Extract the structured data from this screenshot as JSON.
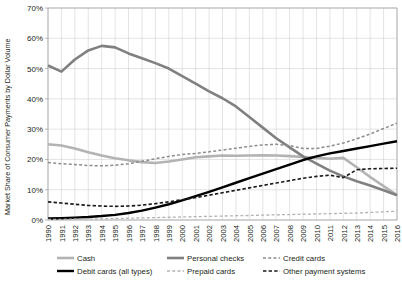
{
  "chart_data": {
    "type": "line",
    "title": "",
    "xlabel": "",
    "ylabel": "Market Share of Consumer Payments by Dollar Volume",
    "ylim": [
      0,
      70
    ],
    "ytick_labels": [
      "0%",
      "10%",
      "20%",
      "30%",
      "40%",
      "50%",
      "60%",
      "70%"
    ],
    "ytick_values": [
      0,
      10,
      20,
      30,
      40,
      50,
      60,
      70
    ],
    "grid": true,
    "legend_position": "bottom",
    "x": [
      1990,
      1991,
      1992,
      1993,
      1994,
      1995,
      1996,
      1997,
      1998,
      1999,
      2000,
      2001,
      2002,
      2003,
      2004,
      2005,
      2006,
      2007,
      2008,
      2009,
      2010,
      2011,
      2012,
      2013,
      2014,
      2015,
      2016
    ],
    "xtick_labels": [
      "1990",
      "1991",
      "1992",
      "1993",
      "1994",
      "1995",
      "1996",
      "1997",
      "1998",
      "1999",
      "2000",
      "2001",
      "2002",
      "2003",
      "2004",
      "2005",
      "2006",
      "2007",
      "2008",
      "2009",
      "2010",
      "2011",
      "2012",
      "2013",
      "2014",
      "2015",
      "2016"
    ],
    "series": [
      {
        "name": "Cash",
        "color": "#b3b3b3",
        "style": "solid",
        "width": 2.6,
        "values": [
          25.0,
          24.6,
          23.6,
          22.4,
          21.3,
          20.4,
          19.7,
          19.1,
          18.8,
          19.3,
          20.0,
          20.7,
          21.0,
          21.3,
          21.2,
          21.3,
          21.4,
          21.3,
          21.1,
          20.8,
          20.5,
          20.2,
          20.5,
          17.4,
          14.2,
          11.2,
          8.2
        ]
      },
      {
        "name": "Personal checks",
        "color": "#808080",
        "style": "solid",
        "width": 2.6,
        "values": [
          51.0,
          49.0,
          53.0,
          56.0,
          57.5,
          57.0,
          55.0,
          53.4,
          51.8,
          50.0,
          47.5,
          45.0,
          42.5,
          40.2,
          37.5,
          34.0,
          30.5,
          27.0,
          24.0,
          21.0,
          18.6,
          16.3,
          14.4,
          12.8,
          11.4,
          9.8,
          8.2
        ]
      },
      {
        "name": "Credit cards",
        "color": "#8c8c8c",
        "style": "dashed",
        "width": 1.5,
        "values": [
          19.0,
          18.6,
          18.3,
          18.0,
          17.9,
          18.1,
          18.6,
          19.4,
          20.2,
          21.0,
          21.6,
          22.0,
          22.5,
          23.1,
          23.7,
          24.3,
          24.8,
          25.0,
          24.6,
          23.6,
          23.6,
          24.4,
          25.4,
          26.8,
          28.4,
          30.2,
          32.0
        ]
      },
      {
        "name": "Debit cards (all types)",
        "color": "#000000",
        "style": "solid",
        "width": 2.4,
        "values": [
          0.5,
          0.6,
          0.8,
          1.0,
          1.3,
          1.7,
          2.3,
          3.1,
          4.1,
          5.2,
          6.5,
          7.9,
          9.3,
          10.8,
          12.3,
          13.8,
          15.3,
          16.8,
          18.3,
          19.8,
          21.0,
          22.0,
          22.8,
          23.6,
          24.4,
          25.2,
          26.0
        ]
      },
      {
        "name": "Prepaid cards",
        "color": "#b3b3b3",
        "style": "dashed",
        "width": 1.3,
        "values": [
          0.2,
          0.2,
          0.3,
          0.3,
          0.4,
          0.5,
          0.6,
          0.7,
          0.8,
          0.9,
          1.0,
          1.1,
          1.2,
          1.3,
          1.4,
          1.5,
          1.6,
          1.7,
          1.8,
          1.9,
          2.0,
          2.1,
          2.2,
          2.3,
          2.5,
          2.7,
          2.9
        ]
      },
      {
        "name": "Other payment systems",
        "color": "#1a1a1a",
        "style": "dashed",
        "width": 1.6,
        "values": [
          6.0,
          5.6,
          5.2,
          4.8,
          4.6,
          4.5,
          4.6,
          4.9,
          5.4,
          6.0,
          6.7,
          7.4,
          8.2,
          9.0,
          9.8,
          10.6,
          11.4,
          12.2,
          13.0,
          13.8,
          14.4,
          14.8,
          14.0,
          16.6,
          16.9,
          17.0,
          17.1
        ]
      }
    ]
  },
  "legend": {
    "items": [
      {
        "label": "Cash",
        "key": "cash"
      },
      {
        "label": "Personal checks",
        "key": "personal-checks"
      },
      {
        "label": "Credit cards",
        "key": "credit-cards"
      },
      {
        "label": "Debit cards (all types)",
        "key": "debit-cards"
      },
      {
        "label": "Prepaid cards",
        "key": "prepaid-cards"
      },
      {
        "label": "Other payment systems",
        "key": "other-payment-systems"
      }
    ]
  }
}
